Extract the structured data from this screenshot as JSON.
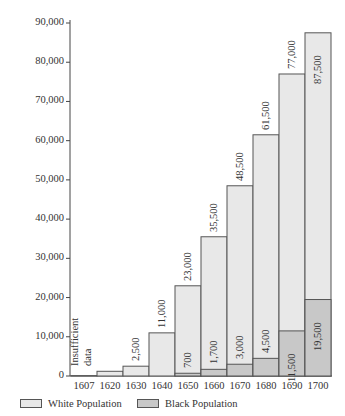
{
  "chart_data": {
    "type": "bar",
    "stacked": true,
    "title": "",
    "xlabel": "",
    "ylabel": "Population",
    "ylim": [
      0,
      90000
    ],
    "yticks": [
      "0",
      "10,000",
      "20,000",
      "30,000",
      "40,000",
      "50,000",
      "60,000",
      "70,000",
      "80,000",
      "90,000"
    ],
    "categories": [
      "1607",
      "1620",
      "1630",
      "1640",
      "1650",
      "1660",
      "1670",
      "1680",
      "1690",
      "1700"
    ],
    "series": [
      {
        "name": "White Population",
        "color": "#e8e8e8",
        "values": [
          100,
          1200,
          2500,
          11000,
          23000,
          35500,
          48500,
          61500,
          77000,
          87500
        ]
      },
      {
        "name": "Black Population",
        "color": "#c8c8c8",
        "values": [
          null,
          null,
          null,
          null,
          700,
          1700,
          3000,
          4500,
          11500,
          19500
        ]
      }
    ],
    "top_labels": [
      "",
      "",
      "2,500",
      "11,000",
      "23,000",
      "35,500",
      "48,500",
      "61,500",
      "77,000",
      "87,500"
    ],
    "black_labels": [
      "",
      "",
      "",
      "",
      "700",
      "1,700",
      "3,000",
      "4,500",
      "11,500",
      "19,500"
    ],
    "annotations": [
      {
        "text": "Insufficient data",
        "at": [
          "1607",
          "1620"
        ]
      }
    ],
    "grid": false,
    "legend_position": "bottom"
  },
  "legend": {
    "white": "White Population",
    "black": "Black Population"
  },
  "annotation_line1": "Insufficient",
  "annotation_line2": "data"
}
